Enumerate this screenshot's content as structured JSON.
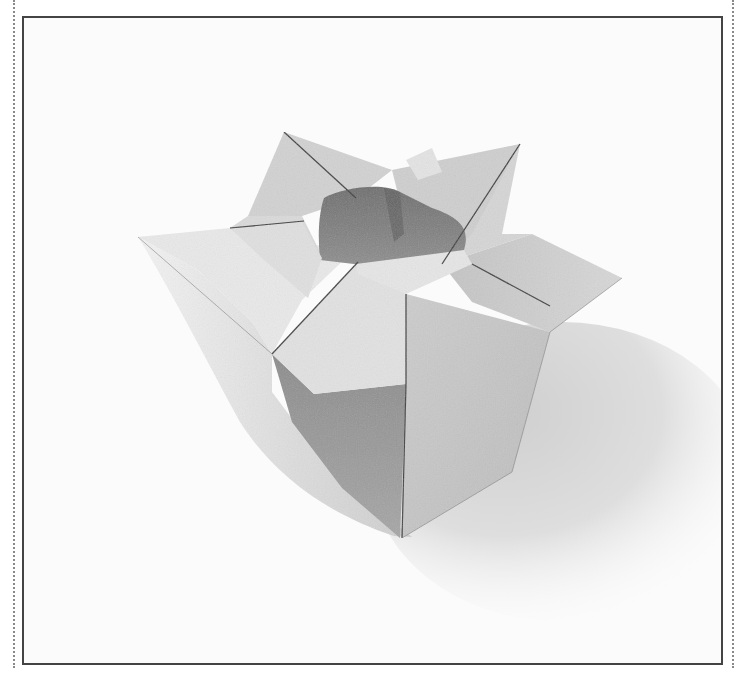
{
  "image": {
    "subject": "Origami vase photograph",
    "description": "Black-and-white photo of a folded paper vase with four pointed flaps around an open top, casting a soft shadow to the lower right",
    "colors": {
      "background": "#fbfbfb",
      "paper_light": "#e4e4e4",
      "paper_mid": "#c9c9c9",
      "paper_dark": "#9a9a9a",
      "interior": "#7a7a7a",
      "shadow": "#d8d8d8",
      "frame_border": "#444444",
      "dotted_rule": "#8a8a8a"
    }
  }
}
